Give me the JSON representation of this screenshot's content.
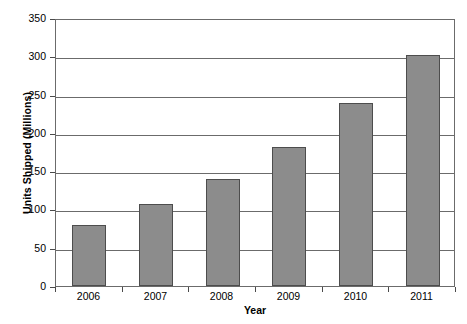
{
  "chart_data": {
    "type": "bar",
    "title": "",
    "subtitle": "",
    "xlabel": "Year",
    "ylabel": "Units Shipped (Millions)",
    "categories": [
      "2006",
      "2007",
      "2008",
      "2009",
      "2010",
      "2011"
    ],
    "values": [
      80,
      107,
      140,
      182,
      239,
      302
    ],
    "series": [
      {
        "name": "Units Shipped",
        "values": [
          80,
          107,
          140,
          182,
          239,
          302
        ]
      }
    ],
    "ylim": [
      0,
      350
    ],
    "ytick_labels": [
      "0",
      "50",
      "100",
      "150",
      "200",
      "250",
      "300",
      "350"
    ],
    "ytick_values": [
      0,
      50,
      100,
      150,
      200,
      250,
      300,
      350
    ],
    "grid": "horizontal",
    "legend": "none",
    "bar_color": "#8c8c8c",
    "bar_border_color": "#4d4d4d",
    "axis_color": "#6b6b6b",
    "background_color": "#ffffff"
  }
}
